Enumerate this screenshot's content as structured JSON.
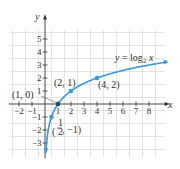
{
  "chart_data": {
    "type": "line",
    "title": "",
    "xlabel": "x",
    "ylabel": "y",
    "xlim": [
      -2.7,
      9.3
    ],
    "ylim": [
      -4,
      6
    ],
    "grid": true,
    "x_ticks": [
      -2,
      -1,
      1,
      2,
      3,
      4,
      5,
      6,
      7,
      8
    ],
    "y_ticks": [
      -3,
      -2,
      -1,
      1,
      2,
      3,
      4,
      5
    ],
    "x_tick_labels": [
      "−2",
      "−1",
      "1",
      "2",
      "3",
      "4",
      "5",
      "6",
      "7",
      "8"
    ],
    "y_tick_labels": [
      "−3",
      "−2",
      "−1",
      "1",
      "2",
      "3",
      "4",
      "5"
    ],
    "series": [
      {
        "name": "y = log₂ x",
        "function": "log2(x)",
        "domain": [
          0.09,
          9.2
        ],
        "color": "#3a9ad9"
      }
    ],
    "points": [
      {
        "x": 0.5,
        "y": -1,
        "label": "(1/2, −1)"
      },
      {
        "x": 1,
        "y": 0,
        "label": "(1, 0)"
      },
      {
        "x": 2,
        "y": 1,
        "label": "(2, 1)"
      },
      {
        "x": 4,
        "y": 2,
        "label": "(4, 2)"
      }
    ],
    "annotations": [
      {
        "text": "y = log₂ x",
        "near": [
          6.5,
          3
        ]
      }
    ]
  },
  "labels": {
    "x_axis": "x",
    "y_axis": "y",
    "fn_y": "y",
    "fn_eq": " = log",
    "fn_sub": "2",
    "fn_x": " x",
    "pt_10": "(1, 0)",
    "pt_21": "(2, 1)",
    "pt_42": "(4, 2)",
    "pt_half_open": "(",
    "pt_half_num": "1",
    "pt_half_den": "2",
    "pt_half_rest": ", −1)"
  },
  "colors": {
    "curve": "#3a9ad9",
    "grid": "#d8d8d8",
    "axis": "#333333"
  }
}
